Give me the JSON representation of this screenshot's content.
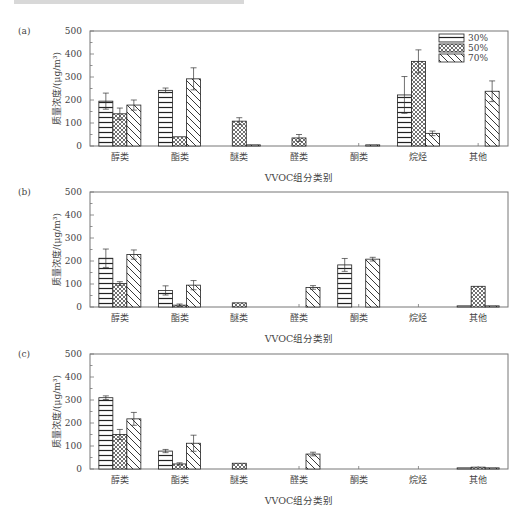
{
  "chart_data": [
    {
      "type": "bar",
      "panel": "(a)",
      "categories": [
        "醇类",
        "酯类",
        "醚类",
        "醛类",
        "酮类",
        "烷烃",
        "其他"
      ],
      "series": [
        {
          "name": "30%",
          "values": [
            195,
            242,
            0,
            0,
            0,
            222,
            0
          ],
          "errors": [
            35,
            10,
            0,
            0,
            0,
            80,
            0
          ]
        },
        {
          "name": "50%",
          "values": [
            140,
            40,
            108,
            35,
            0,
            368,
            0
          ],
          "errors": [
            25,
            0,
            15,
            15,
            0,
            50,
            0
          ]
        },
        {
          "name": "70%",
          "values": [
            178,
            292,
            5,
            0,
            5,
            55,
            238
          ],
          "errors": [
            22,
            48,
            0,
            0,
            0,
            10,
            45
          ]
        }
      ],
      "xlabel": "VVOC组分类别",
      "ylabel": "质量浓度/(μg/m³)",
      "ylim": [
        0,
        500
      ],
      "yticks": [
        0,
        100,
        200,
        300,
        400,
        500
      ],
      "legend_position": "upper right"
    },
    {
      "type": "bar",
      "panel": "(b)",
      "categories": [
        "醇类",
        "酯类",
        "醚类",
        "醛类",
        "酮类",
        "烷烃",
        "其他"
      ],
      "series": [
        {
          "name": "30%",
          "values": [
            212,
            72,
            0,
            0,
            183,
            0,
            5
          ],
          "errors": [
            40,
            20,
            0,
            0,
            28,
            0,
            0
          ]
        },
        {
          "name": "50%",
          "values": [
            102,
            8,
            18,
            0,
            0,
            0,
            90
          ],
          "errors": [
            8,
            5,
            0,
            0,
            0,
            0,
            0
          ]
        },
        {
          "name": "70%",
          "values": [
            228,
            95,
            0,
            85,
            208,
            0,
            5
          ],
          "errors": [
            20,
            20,
            0,
            8,
            8,
            0,
            0
          ]
        }
      ],
      "xlabel": "VVOC组分类别",
      "ylabel": "质量浓度/(μg/m³)",
      "ylim": [
        0,
        500
      ],
      "yticks": [
        0,
        100,
        200,
        300,
        400,
        500
      ]
    },
    {
      "type": "bar",
      "panel": "(c)",
      "categories": [
        "醇类",
        "酯类",
        "醚类",
        "醛类",
        "酮类",
        "烷烃",
        "其他"
      ],
      "series": [
        {
          "name": "30%",
          "values": [
            310,
            78,
            0,
            0,
            0,
            0,
            5
          ],
          "errors": [
            8,
            7,
            0,
            0,
            0,
            0,
            0
          ]
        },
        {
          "name": "50%",
          "values": [
            150,
            22,
            25,
            0,
            0,
            0,
            8
          ],
          "errors": [
            22,
            5,
            0,
            0,
            0,
            0,
            0
          ]
        },
        {
          "name": "70%",
          "values": [
            218,
            112,
            0,
            65,
            0,
            0,
            5
          ],
          "errors": [
            28,
            35,
            0,
            8,
            0,
            0,
            0
          ]
        }
      ],
      "xlabel": "VVOC组分类别",
      "ylabel": "质量浓度/(μg/m³)",
      "ylim": [
        0,
        500
      ],
      "yticks": [
        0,
        100,
        200,
        300,
        400,
        500
      ]
    }
  ],
  "panels": [
    {
      "tag": "(a)",
      "top": 20,
      "show_legend": true
    },
    {
      "tag": "(b)",
      "top": 181,
      "show_legend": false
    },
    {
      "tag": "(c)",
      "top": 343,
      "show_legend": false
    }
  ],
  "legend": [
    {
      "label": "30%",
      "pattern": "horizontal"
    },
    {
      "label": "50%",
      "pattern": "crosshatch"
    },
    {
      "label": "70%",
      "pattern": "diagonal"
    }
  ],
  "colors": {
    "line": "#555555",
    "text": "#444444",
    "frame": "#777777"
  }
}
